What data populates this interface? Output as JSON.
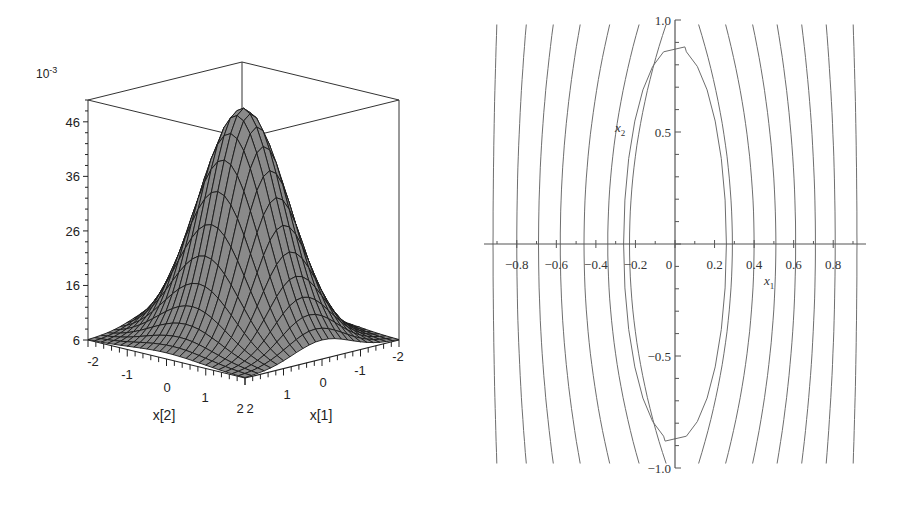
{
  "chart_data": [
    {
      "type": "surface3d",
      "title": "",
      "function_shape": "bell-shaped surface (Gaussian-like ridge) over x[1], x[2]",
      "z_scale_label": "10^-3",
      "z_scale_base": "10",
      "z_scale_exp": "-3",
      "z_ticks": [
        "6",
        "16",
        "26",
        "36",
        "46"
      ],
      "z_tick_values": [
        6,
        16,
        26,
        36,
        46
      ],
      "zlim": [
        6,
        50
      ],
      "x_axis": {
        "label": "x[2]",
        "ticks": [
          "-2",
          "-1",
          "0",
          "1",
          "2"
        ],
        "range": [
          -2,
          2
        ]
      },
      "y_axis": {
        "label": "x[1]",
        "ticks": [
          "2",
          "1",
          "0",
          "-1",
          "-2"
        ],
        "range": [
          -2,
          2
        ]
      },
      "surface_color": "#8a8a8a",
      "grid_color": "#1a1a1a",
      "box": true
    },
    {
      "type": "contour",
      "title": "",
      "xlabel": "x",
      "xlabel_sub": "1",
      "ylabel": "x",
      "ylabel_sub": "2",
      "xlim": [
        -0.95,
        0.95
      ],
      "ylim": [
        -1.0,
        1.0
      ],
      "x_ticks": [
        "-0.8",
        "-0.6",
        "-0.4",
        "-0.2",
        "0",
        "0.2",
        "0.4",
        "0.6",
        "0.8"
      ],
      "x_tick_values": [
        -0.8,
        -0.6,
        -0.4,
        -0.2,
        0,
        0.2,
        0.4,
        0.6,
        0.8
      ],
      "y_ticks": [
        "1.0",
        "0.5",
        "-0.5",
        "-1.0"
      ],
      "y_tick_values": [
        1.0,
        0.5,
        -0.5,
        -1.0
      ],
      "contour_lines_left_x_at_y0": [
        -0.92,
        -0.8,
        -0.69,
        -0.58,
        -0.46,
        -0.34,
        -0.23
      ],
      "contour_lines_right_x_at_y0": [
        0.29,
        0.4,
        0.51,
        0.61,
        0.71,
        0.81,
        0.92
      ],
      "central_ellipse": {
        "half_width": 0.26,
        "half_height": 0.88
      },
      "line_color": "#6e6e6e",
      "grid": false
    }
  ]
}
